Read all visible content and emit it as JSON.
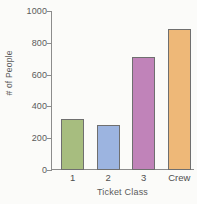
{
  "chart_data": {
    "type": "bar",
    "title": "",
    "xlabel": "Ticket Class",
    "ylabel": "# of People",
    "categories": [
      "1",
      "2",
      "3",
      "Crew"
    ],
    "values": [
      320,
      285,
      710,
      890
    ],
    "ylim": [
      0,
      1000
    ],
    "yticks": [
      0,
      200,
      400,
      600,
      800,
      1000
    ],
    "ytick_labels": [
      "0",
      "200",
      "400",
      "600",
      "800",
      "1000"
    ],
    "grid": false,
    "legend": null,
    "bar_colors": [
      "#a7bd7f",
      "#9cb4e0",
      "#c083b9",
      "#eeb878"
    ],
    "bar_edge_color": "#6f6f6f",
    "axis_color": "#8c8c8c",
    "text_color": "#5a5a5a",
    "background": "#fbfbf9"
  }
}
